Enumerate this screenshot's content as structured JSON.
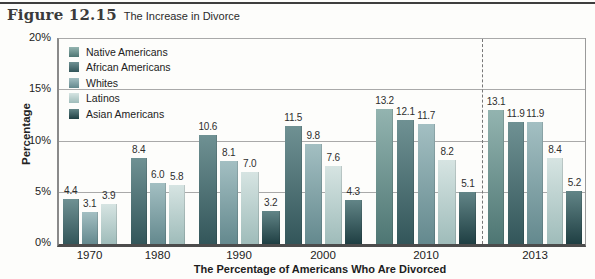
{
  "figure": {
    "label": "Figure 12.15",
    "title": "The Increase in Divorce"
  },
  "chart_data": {
    "type": "bar",
    "title": "The Increase in Divorce",
    "xlabel": "The Percentage of Americans Who Are Divorced",
    "ylabel": "Percentage",
    "ylim": [
      0,
      20
    ],
    "yticks": [
      0,
      5,
      10,
      15,
      20
    ],
    "ytick_labels": [
      "0%",
      "5%",
      "10%",
      "15%",
      "20%"
    ],
    "grid": true,
    "legend_position": "top-left-inside",
    "value_labels_shown": true,
    "categories": [
      "1970",
      "1980",
      "1990",
      "2000",
      "2010",
      "2013"
    ],
    "series": [
      {
        "name": "Native Americans",
        "color": "#6e948f",
        "color_top": "#93b4b0",
        "color_bottom": "#4e7673",
        "values": [
          null,
          null,
          null,
          null,
          13.2,
          13.1
        ]
      },
      {
        "name": "African Americans",
        "color": "#4f7476",
        "color_top": "#6f9193",
        "color_bottom": "#33565a",
        "values": [
          4.4,
          8.4,
          10.6,
          11.5,
          12.1,
          11.9
        ]
      },
      {
        "name": "Whites",
        "color": "#81a1a5",
        "color_top": "#a3bfc2",
        "color_bottom": "#64898e",
        "values": [
          3.1,
          6.0,
          8.1,
          9.8,
          11.7,
          11.9
        ]
      },
      {
        "name": "Latinos",
        "color": "#bdd3d1",
        "color_top": "#d6e4e2",
        "color_bottom": "#9fbcba",
        "values": [
          3.9,
          5.8,
          7.0,
          7.6,
          8.2,
          8.4
        ]
      },
      {
        "name": "Asian Americans",
        "color": "#3d6063",
        "color_top": "#628587",
        "color_bottom": "#1f3f43",
        "values": [
          null,
          null,
          3.2,
          4.3,
          5.1,
          5.2
        ]
      }
    ],
    "separator": {
      "after_category": "2010",
      "style": "dashed"
    }
  }
}
